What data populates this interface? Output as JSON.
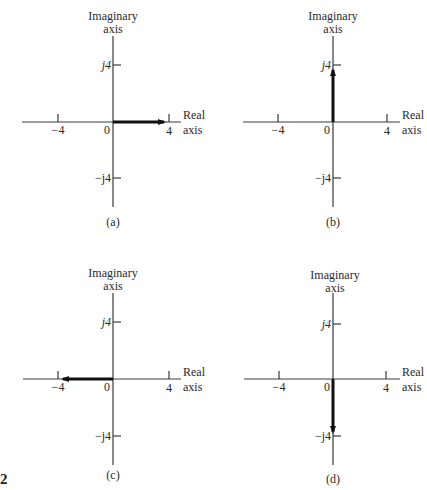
{
  "figure_number": "2",
  "axis_labels": {
    "imaginary_line1": "Imaginary",
    "imaginary_line2": "axis",
    "real_line1": "Real",
    "real_line2": "axis"
  },
  "tick_labels": {
    "neg_real": "−4",
    "origin": "0",
    "pos_real": "4",
    "pos_imag": "j4",
    "neg_imag": "−j4"
  },
  "panels": [
    {
      "id": "a",
      "caption": "(a)",
      "phasor": {
        "real": 4,
        "imag": 0,
        "direction": "right"
      }
    },
    {
      "id": "b",
      "caption": "(b)",
      "phasor": {
        "real": 0,
        "imag": 4,
        "direction": "up"
      }
    },
    {
      "id": "c",
      "caption": "(c)",
      "phasor": {
        "real": -4,
        "imag": 0,
        "direction": "left"
      }
    },
    {
      "id": "d",
      "caption": "(d)",
      "phasor": {
        "real": 0,
        "imag": -4,
        "direction": "down"
      }
    }
  ],
  "colors": {
    "axis": "#3a3a3a",
    "phasor": "#111111",
    "text": "#2a2a2a"
  }
}
